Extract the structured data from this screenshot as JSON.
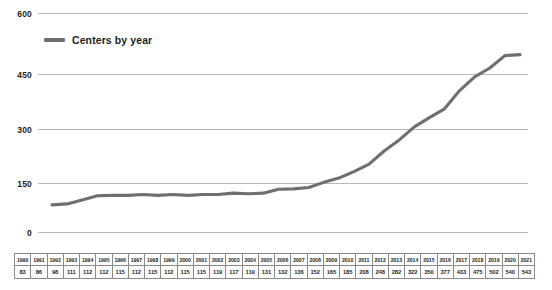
{
  "chart_data": {
    "type": "line",
    "title": "",
    "xlabel": "",
    "ylabel": "",
    "ylim": [
      0,
      600
    ],
    "yticks": [
      0,
      150,
      300,
      450,
      600
    ],
    "grid": true,
    "legend_position": "top-left",
    "line_color": "#6f6f6f",
    "series": [
      {
        "name": "Centers by year",
        "values": [
          83,
          86,
          98,
          111,
          112,
          112,
          115,
          112,
          115,
          112,
          115,
          115,
          119,
          117,
          119,
          131,
          132,
          136,
          152,
          165,
          185,
          208,
          248,
          282,
          322,
          350,
          377,
          433,
          475,
          502,
          540,
          543
        ]
      }
    ],
    "categories": [
      "1990",
      "1991",
      "1992",
      "1993",
      "1994",
      "1995",
      "1996",
      "1997",
      "1998",
      "1999",
      "2000",
      "2001",
      "2002",
      "2003",
      "2004",
      "2005",
      "2006",
      "2007",
      "2008",
      "2009",
      "2010",
      "2011",
      "2012",
      "2013",
      "2014",
      "2015",
      "2016",
      "2017",
      "2018",
      "2019",
      "2020",
      "2021"
    ]
  },
  "legend": {
    "label": "Centers by year"
  },
  "axis": {
    "y_tick_labels": [
      "600",
      "450",
      "300",
      "150",
      "0"
    ]
  },
  "table": {
    "years": [
      "1990",
      "1991",
      "1992",
      "1993",
      "1994",
      "1995",
      "1996",
      "1997",
      "1998",
      "1999",
      "2000",
      "2001",
      "2002",
      "2003",
      "2004",
      "2005",
      "2006",
      "2007",
      "2008",
      "2009",
      "2010",
      "2011",
      "2012",
      "2013",
      "2014",
      "2015",
      "2016",
      "2017",
      "2018",
      "2019",
      "2020",
      "2021"
    ],
    "values": [
      "83",
      "86",
      "98",
      "111",
      "112",
      "112",
      "115",
      "112",
      "115",
      "112",
      "115",
      "115",
      "119",
      "117",
      "119",
      "131",
      "132",
      "136",
      "152",
      "165",
      "185",
      "208",
      "248",
      "282",
      "322",
      "350",
      "377",
      "433",
      "475",
      "502",
      "540",
      "543"
    ]
  }
}
